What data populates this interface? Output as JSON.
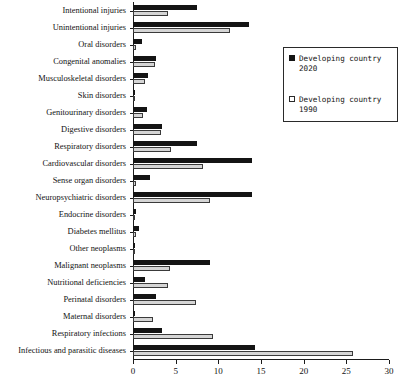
{
  "chart_data": {
    "type": "bar",
    "orientation": "horizontal",
    "title": "",
    "xlabel": "",
    "ylabel": "",
    "xlim": [
      0,
      30
    ],
    "xticks": [
      0,
      5,
      10,
      15,
      20,
      25,
      30
    ],
    "grid": false,
    "legend_position": "upper right",
    "categories": [
      "Intentional injuries",
      "Unintentional injuries",
      "Oral disorders",
      "Congenital anomalies",
      "Musculoskeletal disorders",
      "Skin disorders",
      "Genitourinary disorders",
      "Digestive disorders",
      "Respiratory disorders",
      "Cardiovascular disorders",
      "Sense organ disorders",
      "Neuropsychiatric disorders",
      "Endocrine disorders",
      "Diabetes mellitus",
      "Other neoplasms",
      "Malignant neoplasms",
      "Nutritional deficiencies",
      "Perinatal disorders",
      "Maternal disorders",
      "Respiratory infections",
      "Infectious and parasitic diseases"
    ],
    "series": [
      {
        "name": "Developing country 2020",
        "color": "#141414",
        "values": [
          7.5,
          13.6,
          1.1,
          2.7,
          1.8,
          0.2,
          1.6,
          3.4,
          7.5,
          14.0,
          2.0,
          14.0,
          0.3,
          0.7,
          0.2,
          9.0,
          1.4,
          2.7,
          0.2,
          3.4,
          14.3
        ]
      },
      {
        "name": "Developing country 1990",
        "color": "#d5d5d5",
        "values": [
          4.1,
          11.4,
          0.4,
          2.6,
          1.4,
          0.1,
          1.2,
          3.3,
          4.5,
          8.2,
          0.4,
          9.1,
          0.2,
          0.4,
          0.1,
          4.3,
          4.1,
          7.4,
          2.3,
          9.4,
          25.9
        ]
      }
    ]
  },
  "legend": {
    "entries": [
      {
        "label": "Developing country\n2020",
        "swatch": "filled-black"
      },
      {
        "label": "Developing country\n1990",
        "swatch": "outlined-white"
      }
    ]
  }
}
